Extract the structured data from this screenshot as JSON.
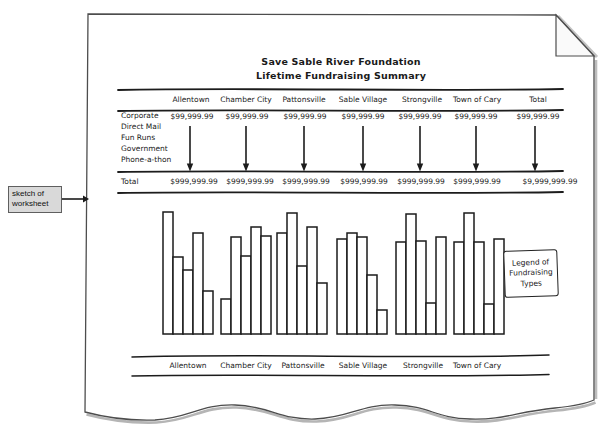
{
  "callout": {
    "label": "sketch of worksheet"
  },
  "paper": {
    "title": "Save Sable River Foundation",
    "subtitle": "Lifetime Fundraising Summary"
  },
  "worksheet": {
    "columns": [
      "Allentown",
      "Chamber City",
      "Pattonsville",
      "Sable Village",
      "Strongville",
      "Town of Cary",
      "Total"
    ],
    "row_labels": [
      "Corporate",
      "Direct Mail",
      "Fun Runs",
      "Government",
      "Phone-a-thon"
    ],
    "detail_values": [
      "$99,999.99",
      "$99,999.99",
      "$99,999.99",
      "$99,999.99",
      "$99,999.99",
      "$99,999.99",
      "$99,999.99"
    ],
    "total_label": "Total",
    "total_values": [
      "$999,999.99",
      "$999,999.99",
      "$999,999.99",
      "$999,999.99",
      "$999,999.99",
      "$999,999.99",
      "$9,999,999.99"
    ]
  },
  "legend": {
    "lines": [
      "Legend of",
      "Fundraising",
      "Types"
    ]
  },
  "chart_data": {
    "type": "bar",
    "title": "",
    "xlabel": "",
    "ylabel": "",
    "axis_labeled": false,
    "grid": false,
    "legend_text": "Legend of Fundraising Types",
    "legend_position": "right",
    "categories": [
      "Allentown",
      "Chamber City",
      "Pattonsville",
      "Sable Village",
      "Strongville",
      "Town of Cary"
    ],
    "series": [
      {
        "name": "Corporate",
        "values": [
          122,
          35,
          101,
          95,
          92,
          92
        ]
      },
      {
        "name": "Direct Mail",
        "values": [
          77,
          97,
          121,
          101,
          120,
          121
        ]
      },
      {
        "name": "Fun Runs",
        "values": [
          64,
          78,
          68,
          97,
          93,
          92
        ]
      },
      {
        "name": "Government",
        "values": [
          101,
          107,
          107,
          59,
          31,
          30
        ]
      },
      {
        "name": "Phone-a-thon",
        "values": [
          43,
          98,
          51,
          24,
          97,
          95
        ]
      }
    ],
    "values_unit": "relative sketch bar height (unlabeled axis)",
    "ylim": [
      0,
      130
    ]
  }
}
